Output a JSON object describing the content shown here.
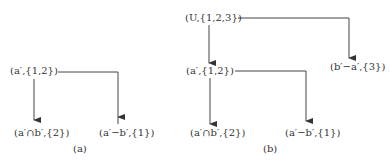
{
  "figure": {
    "panels": [
      {
        "id": "a",
        "caption": "(a)",
        "nodes": {
          "root": "(a′,{1,2})",
          "left_child": "(a′∩b′,{2})",
          "right_child": "(a′−b′,{1})"
        },
        "edges": [
          {
            "from": "(a′,{1,2})",
            "to": "(a′∩b′,{2})"
          },
          {
            "from": "(a′,{1,2})",
            "to": "(a′−b′,{1})"
          }
        ]
      },
      {
        "id": "b",
        "caption": "(b)",
        "nodes": {
          "root": "(U,{1,2,3})",
          "mid": "(a′,{1,2})",
          "right_top": "(b′−a′,{3})",
          "left_child": "(a′∩b′,{2})",
          "right_child": "(a′−b′,{1})"
        },
        "edges": [
          {
            "from": "(U,{1,2,3})",
            "to": "(a′,{1,2})"
          },
          {
            "from": "(U,{1,2,3})",
            "to": "(b′−a′,{3})"
          },
          {
            "from": "(a′,{1,2})",
            "to": "(a′∩b′,{2})"
          },
          {
            "from": "(a′,{1,2})",
            "to": "(a′−b′,{1})"
          }
        ]
      }
    ]
  }
}
